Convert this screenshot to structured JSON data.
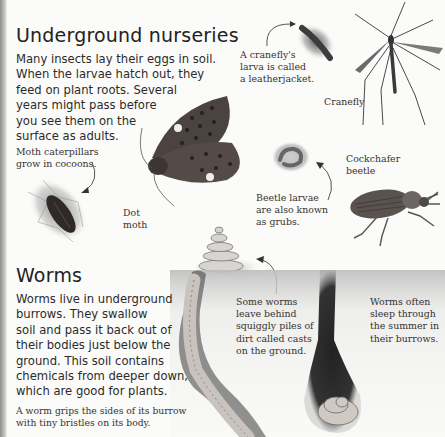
{
  "section1": {
    "title": "Underground nurseries",
    "body": "Many insects lay their eggs in soil.\nWhen the larvae hatch out, they\nfeed on plant roots. Several\nyears might pass before\nyou see them on the\nsurface as adults."
  },
  "captions": {
    "leatherjacket": "A cranefly's\nlarva is called\na leatherjacket.",
    "cranefly": "Cranefly",
    "cocoon": "Moth caterpillars\ngrow in cocoons.",
    "dot_moth": "Dot\nmoth",
    "cockchafer": "Cockchafer\nbeetle",
    "grubs": "Beetle larvae\nare also known\nas grubs.",
    "casts": "Some worms\nleave behind\nsquiggly piles of\ndirt called casts\non the ground.",
    "sleep": "Worms often\nsleep through\nthe summer in\ntheir burrows."
  },
  "section2": {
    "title": "Worms",
    "body": "Worms live in underground\nburrows. They swallow\nsoil and pass it back out of\ntheir bodies just below the\nground. This soil contains\nchemicals from deeper down,\nwhich are good for plants.",
    "note": "A worm grips the sides of its burrow\nwith tiny bristles on its body."
  },
  "colors": {
    "background": "#fbfbf9",
    "text": "#2b2b2b",
    "illustration_dark": "#3a3a3a",
    "illustration_mid": "#8a8a8a"
  }
}
